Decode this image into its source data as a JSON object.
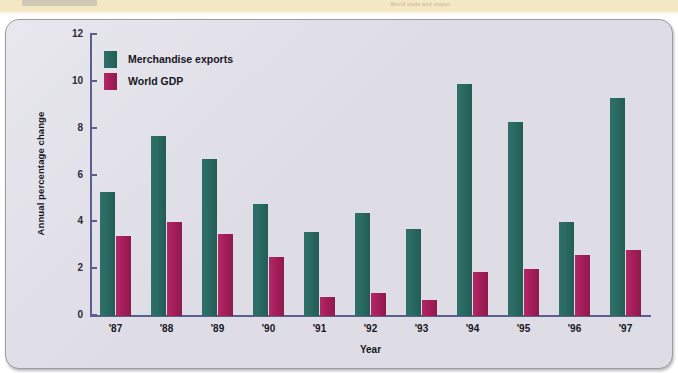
{
  "banner": {
    "caption": "World trade and output"
  },
  "chart_data": {
    "type": "bar",
    "title": "",
    "xlabel": "Year",
    "ylabel": "Annual percentage change",
    "ylim": [
      0,
      12
    ],
    "yticks": [
      0,
      2,
      4,
      6,
      8,
      10,
      12
    ],
    "grid": false,
    "legend_position": "top-left",
    "categories": [
      "'87",
      "'88",
      "'89",
      "'90",
      "'91",
      "'92",
      "'93",
      "'94",
      "'95",
      "'96",
      "'97"
    ],
    "series": [
      {
        "name": "Merchandise exports",
        "color": "#2a6b63",
        "values": [
          5.3,
          7.7,
          6.7,
          4.8,
          3.6,
          4.4,
          3.7,
          9.9,
          8.3,
          4.0,
          9.3
        ]
      },
      {
        "name": "World GDP",
        "color": "#a81e5c",
        "values": [
          3.4,
          4.0,
          3.5,
          2.5,
          0.8,
          1.0,
          0.7,
          1.9,
          2.0,
          2.6,
          2.8
        ]
      }
    ]
  }
}
